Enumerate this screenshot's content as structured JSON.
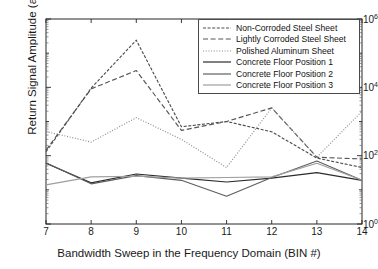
{
  "chart_data": {
    "type": "line",
    "title": "",
    "xlabel": "Bandwidth Sweep in the Frequency Domain (BIN #)",
    "ylabel": "Return Signal Amplitude (a.u.)",
    "yscale": "log",
    "ylim": [
      1,
      1000000
    ],
    "xlim": [
      7,
      14
    ],
    "grid": false,
    "legend_position": "top-right",
    "x": [
      7,
      8,
      9,
      10,
      11,
      12,
      13,
      14
    ],
    "xticks": [
      "7",
      "8",
      "9",
      "10",
      "11",
      "12",
      "13",
      "14"
    ],
    "yticks": [
      "10^0",
      "10^2",
      "10^4",
      "10^6"
    ],
    "ytick_labels": [
      {
        "mantissa": "10",
        "exponent": "0"
      },
      {
        "mantissa": "10",
        "exponent": "2"
      },
      {
        "mantissa": "10",
        "exponent": "4"
      },
      {
        "mantissa": "10",
        "exponent": "6"
      }
    ],
    "series": [
      {
        "name": "Non-Corroded Steel Sheet",
        "style": "dash-dot",
        "color": "#4d4d4d",
        "values": [
          130,
          9500,
          240000,
          700,
          1000,
          500,
          85,
          45
        ]
      },
      {
        "name": "Lightly Corroded Steel Sheet",
        "style": "dashed",
        "color": "#555555",
        "values": [
          145,
          9000,
          31000,
          550,
          1000,
          2500,
          90,
          80
        ]
      },
      {
        "name": "Polished Aluminum Sheet",
        "style": "dotted",
        "color": "#8a8a8a",
        "values": [
          510,
          250,
          1300,
          300,
          45,
          2500,
          90,
          2000
        ]
      },
      {
        "name": "Concrete Floor Position 1",
        "style": "solid",
        "color": "#2b2b2b",
        "values": [
          60,
          16,
          29,
          22,
          17,
          22,
          32,
          19
        ]
      },
      {
        "name": "Concrete Floor Position 2",
        "style": "solid",
        "color": "#5e5e5e",
        "values": [
          62,
          15,
          26,
          19,
          6.5,
          23,
          70,
          19
        ]
      },
      {
        "name": "Concrete Floor Position 3",
        "style": "solid",
        "color": "#9e9e9e",
        "values": [
          14,
          24,
          25,
          22,
          23,
          24,
          60,
          19
        ]
      }
    ]
  },
  "axes": {
    "x_title": "Bandwidth Sweep in the Frequency Domain (BIN #)",
    "y_title": "Return Signal Amplitude (a.u.)"
  },
  "legend": {
    "items": [
      {
        "label": "Non-Corroded Steel Sheet"
      },
      {
        "label": "Lightly Corroded Steel Sheet"
      },
      {
        "label": "Polished Aluminum Sheet"
      },
      {
        "label": "Concrete Floor Position 1"
      },
      {
        "label": "Concrete Floor Position 2"
      },
      {
        "label": "Concrete Floor Position 3"
      }
    ]
  }
}
